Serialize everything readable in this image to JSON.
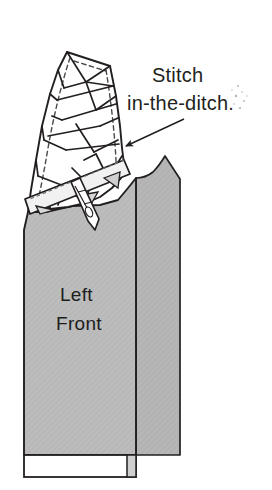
{
  "image": {
    "kind": "line-drawing",
    "subject": "sewing-pattern-illustration",
    "width": 272,
    "height": 490,
    "background_color": "#ffffff"
  },
  "colors": {
    "background": "#ffffff",
    "ink": "#1d1d1d",
    "outline": "#231f20",
    "garment_gray": "#b9b9b9",
    "garment_gray_shadow": "#a9a9a9",
    "binding_light": "#f2f2f2",
    "binding_shade": "#d8d8d8",
    "speckle": "#b0b0b0"
  },
  "annotations": {
    "callout": {
      "line1": "Stitch",
      "line2": "in-the-ditch.",
      "line1_x": 152,
      "line1_y": 82,
      "line2_x": 127,
      "line2_y": 110,
      "arrow_from_x": 184,
      "arrow_from_y": 119,
      "arrow_to_x": 120,
      "arrow_to_y": 149
    }
  },
  "labels": {
    "piece": {
      "line1": "Left",
      "line2": "Front",
      "line1_x": 60,
      "line1_y": 301,
      "line2_x": 56,
      "line2_y": 330
    }
  },
  "chart_data": {
    "type": "diagram",
    "shapes": [
      {
        "name": "left-front-body",
        "fill": "#b9b9b9",
        "description": "Large gray garment front panel with slight taper"
      },
      {
        "name": "right-facing-panel",
        "fill": "#b9b9b9",
        "description": "Secondary gray panel to the right of the front edge, curved neckline at top"
      },
      {
        "name": "bound-neckline-patchwork",
        "fill": "#ffffff",
        "description": "White patchwork collar area made of triangular pieced sections with dashed seam guides"
      },
      {
        "name": "bias-binding-strip",
        "fill": "#f2f2f2",
        "description": "Diagonal bias binding strip crossing lower-left of the patchwork"
      },
      {
        "name": "needle",
        "fill": "#ffffff",
        "description": "Pointed needle shape passing through the binding"
      },
      {
        "name": "bottom-hem-band",
        "fill": "#ffffff",
        "description": "White hem facing band along the bottom of the Left Front"
      }
    ]
  }
}
